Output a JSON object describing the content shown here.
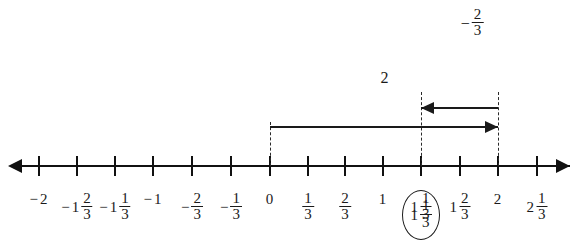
{
  "diagram": {
    "type": "number-line",
    "title": "",
    "axis": {
      "arrow_left": "left-arrowhead",
      "arrow_right": "right-arrowhead",
      "min_label": "-2",
      "max_label": "2 1/3",
      "step": "1/3"
    },
    "ticks": [
      {
        "x": 39,
        "value": -2,
        "sign": "−",
        "whole": "2",
        "num": "",
        "den": ""
      },
      {
        "x": 77,
        "value": -1.6667,
        "sign": "−",
        "whole": "1",
        "num": "2",
        "den": "3"
      },
      {
        "x": 115,
        "value": -1.3333,
        "sign": "−",
        "whole": "1",
        "num": "1",
        "den": "3"
      },
      {
        "x": 153,
        "value": -1,
        "sign": "−",
        "whole": "1",
        "num": "",
        "den": ""
      },
      {
        "x": 192,
        "value": -0.6667,
        "sign": "−",
        "whole": "",
        "num": "2",
        "den": "3"
      },
      {
        "x": 231,
        "value": -0.3333,
        "sign": "−",
        "whole": "",
        "num": "1",
        "den": "3"
      },
      {
        "x": 270,
        "value": 0,
        "sign": "",
        "whole": "0",
        "num": "",
        "den": ""
      },
      {
        "x": 308,
        "value": 0.3333,
        "sign": "",
        "whole": "",
        "num": "1",
        "den": "3"
      },
      {
        "x": 345,
        "value": 0.6667,
        "sign": "",
        "whole": "",
        "num": "2",
        "den": "3"
      },
      {
        "x": 383,
        "value": 1,
        "sign": "",
        "whole": "1",
        "num": "",
        "den": ""
      },
      {
        "x": 421,
        "value": 1.3333,
        "sign": "",
        "whole": "1",
        "num": "1",
        "den": "3"
      },
      {
        "x": 460,
        "value": 1.6667,
        "sign": "",
        "whole": "1",
        "num": "2",
        "den": "3"
      },
      {
        "x": 498,
        "value": 2,
        "sign": "",
        "whole": "2",
        "num": "",
        "den": ""
      },
      {
        "x": 537,
        "value": 2.3333,
        "sign": "",
        "whole": "2",
        "num": "1",
        "den": "3"
      }
    ],
    "circled_answer": {
      "x": 421,
      "value": 1.3333,
      "whole": "1",
      "num": "1",
      "den": "3"
    },
    "dashed_lines": [
      {
        "name": "dashed-line-zero",
        "x": 270,
        "top": 122,
        "bottom": 166
      },
      {
        "name": "dashed-line-one-third",
        "x": 421,
        "top": 92,
        "bottom": 166
      },
      {
        "name": "dashed-line-two",
        "x": 498,
        "top": 92,
        "bottom": 166
      }
    ],
    "operations": [
      {
        "name": "add-two-arrow",
        "direction": "right",
        "from_x": 270,
        "to_x": 498,
        "y": 126,
        "label": {
          "text": "2",
          "sign": "",
          "whole": "2",
          "num": "",
          "den": "",
          "x": 385,
          "y": 70
        }
      },
      {
        "name": "subtract-two-thirds-arrow",
        "direction": "left",
        "from_x": 498,
        "to_x": 421,
        "y": 107,
        "label": {
          "text": "-2/3",
          "sign": "−",
          "whole": "",
          "num": "2",
          "den": "3",
          "x": 472,
          "y": 8
        }
      }
    ],
    "colors": {
      "line": "#111111",
      "dashed": "#2a2a2a",
      "text": "#1a1a1a",
      "background": "#ffffff"
    }
  }
}
